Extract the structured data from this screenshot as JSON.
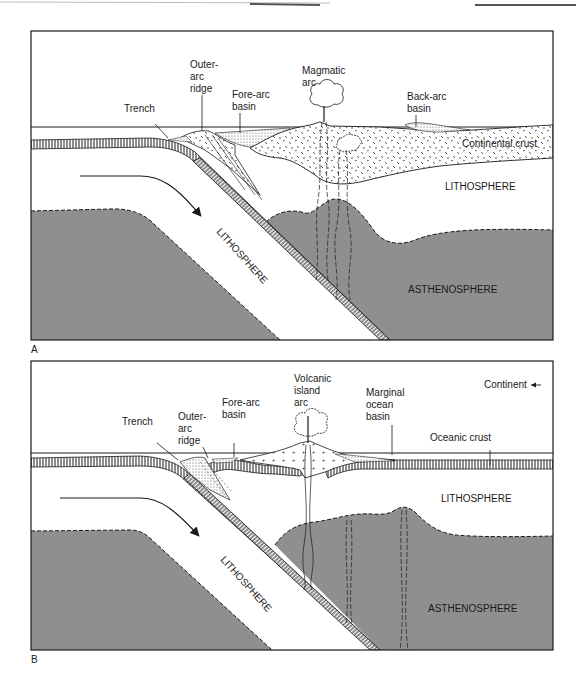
{
  "figure": {
    "panels": [
      {
        "id": "A",
        "letter": "A",
        "labels": {
          "trench": "Trench",
          "outer_arc_ridge": [
            "Outer-",
            "arc",
            "ridge"
          ],
          "fore_arc_basin": [
            "Fore-arc",
            "basin"
          ],
          "magmatic_arc": [
            "Magmatic",
            "arc"
          ],
          "back_arc_basin": [
            "Back-arc",
            "basin"
          ],
          "continental_crust": "Continental crust",
          "lithosphere_upper": "LITHOSPHERE",
          "lithosphere_slab": "LITHOSPHERE",
          "asthenosphere": "ASTHENOSPHERE"
        }
      },
      {
        "id": "B",
        "letter": "B",
        "labels": {
          "trench": "Trench",
          "outer_arc_ridge": [
            "Outer-",
            "arc",
            "ridge"
          ],
          "fore_arc_basin": [
            "Fore-arc",
            "basin"
          ],
          "volcanic_island_arc": [
            "Volcanic",
            "island",
            "arc"
          ],
          "marginal_ocean_basin": [
            "Marginal",
            "ocean",
            "basin"
          ],
          "continent": "Continent",
          "oceanic_crust": "Oceanic crust",
          "lithosphere_upper": "LITHOSPHERE",
          "lithosphere_slab": "LITHOSPHERE",
          "asthenosphere": "ASTHENOSPHERE"
        }
      }
    ],
    "colors": {
      "asthenosphere_fill": "#8f8f8f",
      "line": "#1a1a1a",
      "background": "#ffffff"
    }
  }
}
